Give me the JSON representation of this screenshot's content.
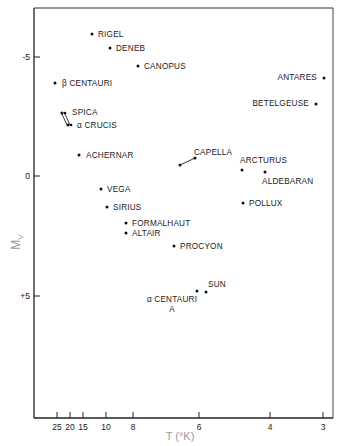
{
  "chart_data": {
    "type": "scatter",
    "title": "",
    "xlabel": "T (°K)",
    "ylabel": "M_V",
    "x_scale": "log, reversed (thousands of K)",
    "xticks": [
      {
        "label": "25",
        "px": 57
      },
      {
        "label": "20",
        "px": 70
      },
      {
        "label": "15",
        "px": 83
      },
      {
        "label": "10",
        "px": 106
      },
      {
        "label": "8",
        "px": 133
      },
      {
        "label": "6",
        "px": 199
      },
      {
        "label": "4",
        "px": 270
      },
      {
        "label": "3",
        "px": 323
      }
    ],
    "yticks": [
      {
        "label": "-5",
        "value": -5,
        "px": 57
      },
      {
        "label": "0",
        "value": 0,
        "px": 176
      },
      {
        "label": "+5",
        "value": 5,
        "px": 296
      }
    ],
    "ylim": [
      -7,
      10
    ],
    "grid": false,
    "legend": null,
    "points": [
      {
        "name": "RIGEL",
        "T_k": 12,
        "Mv": -6.0,
        "px": 92,
        "py": 34,
        "lx": 98,
        "ly": 37,
        "anchor": "start"
      },
      {
        "name": "DENEB",
        "T_k": 10,
        "Mv": -5.4,
        "px": 110,
        "py": 48,
        "lx": 116,
        "ly": 51,
        "anchor": "start"
      },
      {
        "name": "CANOPUS",
        "T_k": 7.5,
        "Mv": -4.6,
        "px": 138,
        "py": 66,
        "lx": 144,
        "ly": 69,
        "anchor": "start"
      },
      {
        "name": "β CENTAURI",
        "T_k": 25,
        "Mv": -3.9,
        "px": 55,
        "py": 83,
        "lx": 62,
        "ly": 86,
        "anchor": "start"
      },
      {
        "name": "SPICA",
        "T_k": 22,
        "Mv": -2.6,
        "px": 62,
        "py": 113,
        "lx": 72,
        "ly": 115,
        "anchor": "start"
      },
      {
        "name": "α CRUCIS",
        "T_k": 20,
        "Mv": -2.2,
        "px": 68,
        "py": 125,
        "lx": 77,
        "ly": 128,
        "anchor": "start"
      },
      {
        "name": "ACHERNAR",
        "T_k": 14,
        "Mv": -0.9,
        "px": 79,
        "py": 155,
        "lx": 86,
        "ly": 158,
        "anchor": "start"
      },
      {
        "name": "CAPELLA",
        "T_k": 6,
        "Mv": -0.5,
        "px": 195,
        "py": 158,
        "lx": 194,
        "ly": 155,
        "anchor": "start"
      },
      {
        "name": "ARCTURUS",
        "T_k": 4.3,
        "Mv": -0.3,
        "px": 242,
        "py": 170,
        "lx": 240,
        "ly": 163,
        "anchor": "start"
      },
      {
        "name": "ALDEBARAN",
        "T_k": 3.9,
        "Mv": -0.2,
        "px": 265,
        "py": 172,
        "lx": 262,
        "ly": 184,
        "anchor": "start"
      },
      {
        "name": "ANTARES",
        "T_k": 3.3,
        "Mv": -4.0,
        "px": 324,
        "py": 78,
        "lx": 317,
        "ly": 80,
        "anchor": "end"
      },
      {
        "name": "BETELGEUSE",
        "T_k": 3.4,
        "Mv": -3.0,
        "px": 316,
        "py": 104,
        "lx": 309,
        "ly": 106,
        "anchor": "end"
      },
      {
        "name": "VEGA",
        "T_k": 10,
        "Mv": 0.6,
        "px": 101,
        "py": 189,
        "lx": 107,
        "ly": 192,
        "anchor": "start"
      },
      {
        "name": "POLLUX",
        "T_k": 4.7,
        "Mv": 1.0,
        "px": 243,
        "py": 203,
        "lx": 249,
        "ly": 206,
        "anchor": "start"
      },
      {
        "name": "SIRIUS",
        "T_k": 10,
        "Mv": 1.4,
        "px": 107,
        "py": 207,
        "lx": 113,
        "ly": 210,
        "anchor": "start"
      },
      {
        "name": "FORMALHAUT",
        "T_k": 9,
        "Mv": 1.9,
        "px": 126,
        "py": 223,
        "lx": 132,
        "ly": 226,
        "anchor": "start"
      },
      {
        "name": "ALTAIR",
        "T_k": 8,
        "Mv": 2.3,
        "px": 126,
        "py": 233,
        "lx": 132,
        "ly": 236,
        "anchor": "start"
      },
      {
        "name": "PROCYON",
        "T_k": 6.5,
        "Mv": 2.8,
        "px": 174,
        "py": 246,
        "lx": 180,
        "ly": 249,
        "anchor": "start"
      },
      {
        "name": "SUN",
        "T_k": 5.8,
        "Mv": 4.8,
        "px": 206,
        "py": 292,
        "lx": 208,
        "ly": 287,
        "anchor": "start"
      },
      {
        "name": "α CENTAURI A",
        "T_k": 6,
        "Mv": 4.4,
        "px": 197,
        "py": 291,
        "lx": 172,
        "ly": 302,
        "anchor": "middle",
        "line2": "A",
        "l2x": 172,
        "l2y": 312
      }
    ],
    "connectors": [
      {
        "name": "spica-crucis-line-1",
        "x1": 61,
        "y1": 112,
        "x2": 67,
        "y2": 125
      },
      {
        "name": "spica-crucis-line-2",
        "x1": 64,
        "y1": 112,
        "x2": 70,
        "y2": 125
      },
      {
        "name": "capella-line",
        "x1": 180,
        "y1": 165,
        "x2": 195,
        "y2": 158
      }
    ]
  }
}
